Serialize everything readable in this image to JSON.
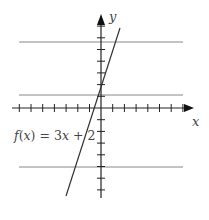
{
  "figure": {
    "function_label": "f(x) = 3x + 2",
    "x_axis_label": "x",
    "y_axis_label": "y",
    "colors": {
      "axis": "#222222",
      "function_line": "#333333",
      "horizontal_lines": "#888888",
      "text": "#444444"
    }
  },
  "chart_data": {
    "type": "line",
    "title": "",
    "xlabel": "x",
    "ylabel": "y",
    "grid": false,
    "series": [
      {
        "name": "f(x) = 3x + 2",
        "slope": 3,
        "intercept": 2,
        "x": [
          -3,
          1.67
        ],
        "y": [
          -7,
          7
        ]
      }
    ],
    "horizontal_lines": [
      {
        "y": 6
      },
      {
        "y": 1
      },
      {
        "y": -5
      }
    ],
    "x_ticks": [
      -8,
      -7,
      -6,
      -5,
      -4,
      -3,
      -2,
      -1,
      1,
      2,
      3,
      4,
      5,
      6,
      7
    ],
    "y_ticks": [
      -7,
      -6,
      -5,
      -4,
      -3,
      -2,
      -1,
      1,
      2,
      3,
      4,
      5,
      6,
      7
    ],
    "xlim": [
      -8,
      8
    ],
    "ylim": [
      -8,
      8
    ]
  }
}
